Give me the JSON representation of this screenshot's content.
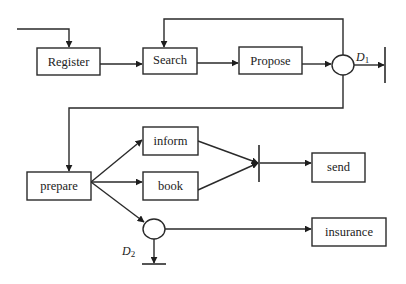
{
  "diagram": {
    "type": "process-flow",
    "nodes": [
      {
        "id": "register",
        "label": "Register",
        "kind": "task"
      },
      {
        "id": "search",
        "label": "Search",
        "kind": "task"
      },
      {
        "id": "propose",
        "label": "Propose",
        "kind": "task"
      },
      {
        "id": "d1",
        "label": "D",
        "sub": "1",
        "kind": "decision"
      },
      {
        "id": "prepare",
        "label": "prepare",
        "kind": "task"
      },
      {
        "id": "inform",
        "label": "inform",
        "kind": "task"
      },
      {
        "id": "book",
        "label": "book",
        "kind": "task"
      },
      {
        "id": "join",
        "label": "",
        "kind": "and-join"
      },
      {
        "id": "send",
        "label": "send",
        "kind": "task"
      },
      {
        "id": "d2",
        "label": "D",
        "sub": "2",
        "kind": "decision"
      },
      {
        "id": "insurance",
        "label": "insurance",
        "kind": "task"
      }
    ],
    "edges": [
      {
        "from": "start",
        "to": "register"
      },
      {
        "from": "register",
        "to": "search"
      },
      {
        "from": "search",
        "to": "propose"
      },
      {
        "from": "propose",
        "to": "d1"
      },
      {
        "from": "d1",
        "to": "search",
        "note": "loop back"
      },
      {
        "from": "d1",
        "to": "end-1"
      },
      {
        "from": "d1",
        "to": "prepare"
      },
      {
        "from": "prepare",
        "to": "inform"
      },
      {
        "from": "prepare",
        "to": "book"
      },
      {
        "from": "prepare",
        "to": "d2"
      },
      {
        "from": "inform",
        "to": "join"
      },
      {
        "from": "book",
        "to": "join"
      },
      {
        "from": "join",
        "to": "send"
      },
      {
        "from": "d2",
        "to": "insurance"
      },
      {
        "from": "d2",
        "to": "end-2"
      }
    ]
  },
  "labels": {
    "register": "Register",
    "search": "Search",
    "propose": "Propose",
    "prepare": "prepare",
    "inform": "inform",
    "book": "book",
    "send": "send",
    "insurance": "insurance",
    "d1_main": "D",
    "d1_sub": "1",
    "d2_main": "D",
    "d2_sub": "2"
  }
}
